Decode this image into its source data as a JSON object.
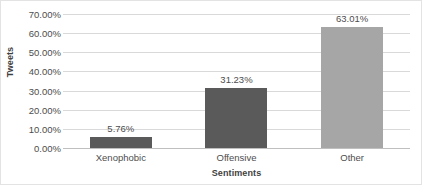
{
  "chart_data": {
    "type": "bar",
    "title": "",
    "subtitle": "",
    "xlabel": "Sentiments",
    "ylabel": "Tweets",
    "categories": [
      "Xenophobic",
      "Offensive",
      "Other"
    ],
    "values": [
      5.76,
      31.23,
      63.01
    ],
    "data_labels": [
      "5.76%",
      "31.23%",
      "63.01%"
    ],
    "bar_colors": [
      "#5a5a5a",
      "#5a5a5a",
      "#a6a6a6"
    ],
    "ylim": [
      0,
      70
    ],
    "ytick_values": [
      0,
      10,
      20,
      30,
      40,
      50,
      60,
      70
    ],
    "ytick_labels": [
      "0.00%",
      "10.00%",
      "20.00%",
      "30.00%",
      "40.00%",
      "50.00%",
      "60.00%",
      "70.00%"
    ],
    "grid": true,
    "grid_axis": "y",
    "legend": false,
    "legend_position": "none",
    "gridline_color": "#d9d9d9",
    "axis_color": "#bfbfbf",
    "text_color": "#4d4d4d",
    "background_color": "#ffffff"
  }
}
